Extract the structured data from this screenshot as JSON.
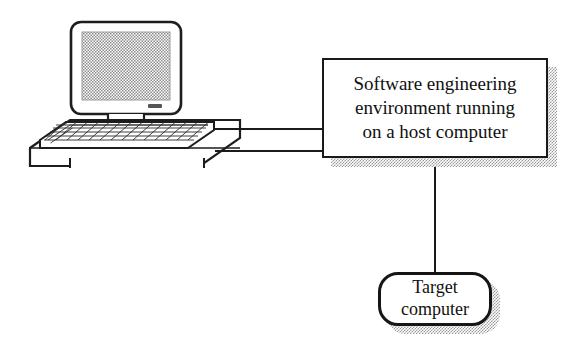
{
  "diagram": {
    "type": "block-diagram",
    "background_color": "#ffffff",
    "line_color": "#1a1a1a",
    "shadow_style": "halftone-dot",
    "shadow_color": "#9a9a9a"
  },
  "nodes": {
    "host": {
      "label": "Software engineering\nenvironment running\non a host computer",
      "shape": "rectangle",
      "has_shadow": true
    },
    "target": {
      "label": "Target\ncomputer",
      "shape": "rounded-rectangle",
      "has_shadow": true
    },
    "workstation": {
      "label": "desktop-computer-illustration",
      "parts": [
        "crt-monitor",
        "monitor-screen",
        "power-indicator",
        "keyboard",
        "desk-surface"
      ]
    }
  },
  "connections": [
    {
      "from": "workstation",
      "to": "host",
      "style": "double-line-cable",
      "orientation": "horizontal"
    },
    {
      "from": "host",
      "to": "target",
      "style": "single-line",
      "orientation": "vertical"
    }
  ]
}
